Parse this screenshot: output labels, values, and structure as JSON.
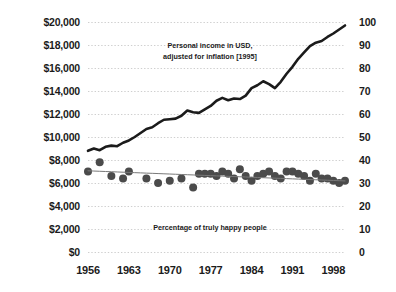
{
  "chart_data": {
    "type": "line",
    "title": "",
    "subtitle": "",
    "xlabel": "",
    "ylabel": "",
    "grid": true,
    "legend_position": "none",
    "x": [
      1956,
      1957,
      1958,
      1959,
      1960,
      1961,
      1962,
      1963,
      1964,
      1965,
      1966,
      1967,
      1968,
      1969,
      1970,
      1971,
      1972,
      1973,
      1974,
      1975,
      1976,
      1977,
      1978,
      1979,
      1980,
      1981,
      1982,
      1983,
      1984,
      1985,
      1986,
      1987,
      1988,
      1989,
      1990,
      1991,
      1992,
      1993,
      1994,
      1995,
      1996,
      1997,
      1998,
      1999,
      2000
    ],
    "xlim": [
      1956,
      2000
    ],
    "xticks": [
      1956,
      1963,
      1970,
      1977,
      1984,
      1991,
      1998
    ],
    "xtick_labels": [
      "1956",
      "1963",
      "1970",
      "1977",
      "1984",
      "1991",
      "1998"
    ],
    "axes": [
      {
        "id": "left",
        "side": "left",
        "label": "",
        "lim": [
          0,
          20000
        ],
        "ticks": [
          0,
          2000,
          4000,
          6000,
          8000,
          10000,
          12000,
          14000,
          16000,
          18000,
          20000
        ],
        "tick_labels": [
          "$0",
          "$2,000",
          "$4,000",
          "$6,000",
          "$8,000",
          "$10,000",
          "$12,000",
          "$14,000",
          "$16,000",
          "$18,000",
          "$20,000"
        ]
      },
      {
        "id": "right",
        "side": "right",
        "label": "",
        "lim": [
          0,
          100
        ],
        "ticks": [
          0,
          10,
          20,
          30,
          40,
          50,
          60,
          70,
          80,
          90,
          100
        ],
        "tick_labels": [
          "0",
          "10",
          "20",
          "30",
          "40",
          "50",
          "60",
          "70",
          "80",
          "90",
          "100"
        ]
      }
    ],
    "series": [
      {
        "name": "Personal income in USD, adjusted for inflation [1995]",
        "type": "line",
        "axis": "left",
        "color": "#1b1b1b",
        "line_width": 2.6,
        "values": [
          8800,
          9000,
          8850,
          9150,
          9250,
          9200,
          9500,
          9700,
          10000,
          10350,
          10700,
          10850,
          11200,
          11500,
          11550,
          11600,
          11850,
          12300,
          12150,
          12100,
          12400,
          12700,
          13150,
          13400,
          13200,
          13350,
          13300,
          13600,
          14250,
          14500,
          14850,
          14600,
          14250,
          14800,
          15500,
          16100,
          16800,
          17350,
          17900,
          18200,
          18350,
          18700,
          19000,
          19350,
          19700
        ]
      },
      {
        "name": "Percentage of truly happy people",
        "type": "scatter",
        "axis": "right",
        "color": "#4b4b4b",
        "marker_size": 5.2,
        "values": [
          35,
          null,
          39,
          null,
          33,
          null,
          32,
          35,
          null,
          null,
          32,
          null,
          30,
          null,
          31,
          null,
          32,
          null,
          28,
          34,
          34,
          34,
          33,
          35,
          34,
          32,
          36,
          33,
          31,
          33,
          34,
          35,
          33,
          32,
          35,
          35,
          34,
          33,
          31,
          34,
          32,
          32,
          31,
          30,
          31
        ]
      },
      {
        "name": "Happiness trend line",
        "type": "line",
        "axis": "right",
        "color": "#787878",
        "line_width": 1,
        "values": [
          35.3,
          35.2,
          35.1,
          35.0,
          34.9,
          34.8,
          34.7,
          34.6,
          34.5,
          34.4,
          34.3,
          34.2,
          34.1,
          34.0,
          33.9,
          33.8,
          33.7,
          33.6,
          33.5,
          33.4,
          33.3,
          33.2,
          33.1,
          33.0,
          32.9,
          32.8,
          32.7,
          32.6,
          32.5,
          32.4,
          32.3,
          32.2,
          32.1,
          32.0,
          31.9,
          31.8,
          31.7,
          31.6,
          31.5,
          31.4,
          31.3,
          31.2,
          31.1,
          31.0,
          30.9
        ]
      }
    ],
    "annotations": [
      {
        "id": "income-annotation",
        "lines": [
          "Personal income in USD,",
          "adjusted for inflation [1995]"
        ],
        "x_px": 210,
        "y_px": 40
      },
      {
        "id": "happiness-annotation",
        "lines": [
          "Percentage of truly happy people"
        ],
        "x_px": 210,
        "y_px": 222
      }
    ]
  }
}
